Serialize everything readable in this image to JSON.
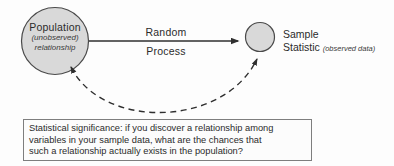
{
  "figure": {
    "nodes": {
      "population": {
        "title": "Population",
        "subtitle_line1": "(unobserved)",
        "subtitle_line2": "relationship"
      },
      "sample": {
        "title_line1": "Sample",
        "title_line2": "Statistic",
        "annotation": "(observed data)"
      }
    },
    "process_arrow": {
      "label_top": "Random",
      "label_bottom": "Process"
    },
    "caption_box": {
      "lines": [
        "Statistical significance: if you discover a relationship among",
        "variables in your sample data, what are the chances that",
        "such a relationship actually exists in the population?"
      ]
    },
    "colors": {
      "node_fill": "#d9d9d9",
      "node_border": "#4a4a4a",
      "line": "#2f2f2f",
      "box_border": "#7e7e7e",
      "text": "#2b2b2b",
      "background": "#fdfdfd"
    }
  }
}
